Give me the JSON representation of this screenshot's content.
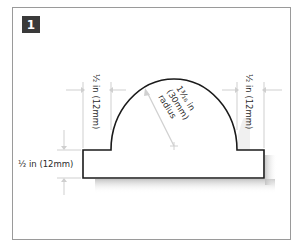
{
  "figure": {
    "step_number": "1",
    "colors": {
      "frame_border": "#9a9a9a",
      "badge_bg": "#3a3a3a",
      "badge_text": "#ffffff",
      "outline": "#1a1a1a",
      "dimension_lines": "#c8c8c8",
      "label_text": "#2b2b2b"
    }
  },
  "dimensions": {
    "left_step_width": "½ in (12mm)",
    "right_step_width": "½ in (12mm)",
    "base_height": "½ in (12mm)",
    "radius_line1": "1³⁄₁₆ in",
    "radius_line2": "(30mm)",
    "radius_line3": "radius"
  }
}
